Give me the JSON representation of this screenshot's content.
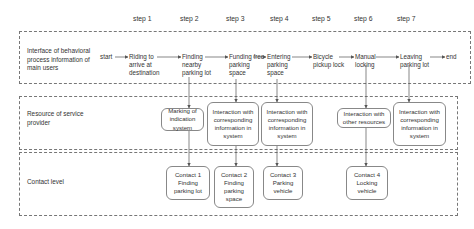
{
  "steps": [
    "step 1",
    "step 2",
    "step 3",
    "step 4",
    "step 5",
    "step 6",
    "step 7"
  ],
  "lanes": {
    "user": "Interface of behavioral process information of main users",
    "resource": "Resource of service provider",
    "contact": "Contact level"
  },
  "flow": {
    "start": "start",
    "end": "end",
    "nodes": [
      "Riding to arrive at destination",
      "Finding nearby parking lot",
      "Funding free parking space",
      "Entering parking space",
      "Bicycle pickup lock",
      "Manual locking",
      "Leaving parking lot"
    ]
  },
  "resources": [
    "Marking of indication system",
    "Interaction with corresponding information in system",
    "Interaction with corresponding information in system",
    "Interaction with other resources",
    "Interaction with corresponding information in system"
  ],
  "contacts": [
    "Contact 1 Finding parking lot",
    "Contact 2 Finding parking space",
    "Contact 3 Parking vehicle",
    "Contact 4 Locking vehicle"
  ],
  "colors": {
    "line": "#555555",
    "border": "#888888",
    "text": "#333333"
  }
}
